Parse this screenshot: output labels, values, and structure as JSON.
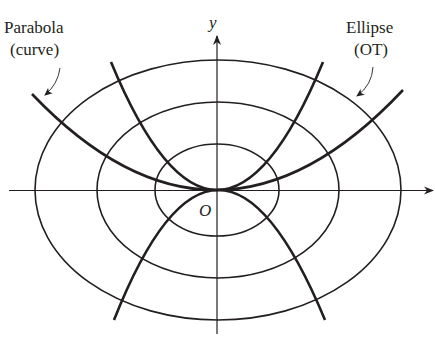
{
  "diagram": {
    "colors": {
      "ink": "#231f20",
      "background": "#ffffff"
    },
    "axes": {
      "x_label": "",
      "y_label": "y",
      "origin_label": "O"
    },
    "labels": {
      "parabola_line1": "Parabola",
      "parabola_line2": "(curve)",
      "ellipse_line1": "Ellipse",
      "ellipse_line2": "(OT)"
    },
    "families": {
      "ellipses": {
        "count": 3,
        "description": "concentric ellipses centered at origin (orthogonal trajectories)"
      },
      "parabolas": {
        "count": 4,
        "description": "parabolas through origin, vertex at O, opening up and down"
      }
    }
  }
}
